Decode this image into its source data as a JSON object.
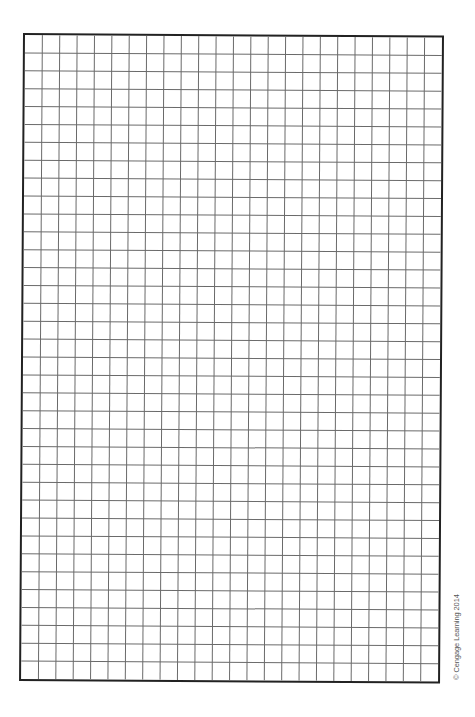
{
  "graph_paper": {
    "columns": 24,
    "rows": 36,
    "line_color": "#6a6a6a",
    "border_color": "#222222"
  },
  "credit": {
    "text": "© Cengage Learning 2014"
  }
}
